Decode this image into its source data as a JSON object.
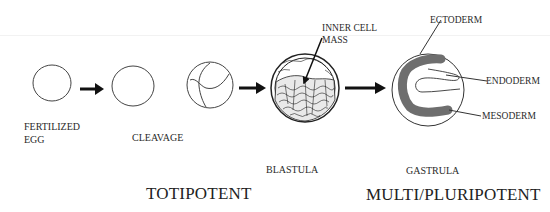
{
  "diagram": {
    "stages": [
      {
        "id": "fertilized-egg",
        "label_line1": "FERTILIZED",
        "label_line2": "EGG"
      },
      {
        "id": "cleavage",
        "label": "CLEAVAGE"
      },
      {
        "id": "blastula",
        "label": "BLASTULA"
      },
      {
        "id": "gastrula",
        "label": "GASTRULA"
      }
    ],
    "annotations": {
      "inner_cell_mass_line1": "INNER CELL",
      "inner_cell_mass_line2": "MASS",
      "ectoderm": "ECTODERM",
      "endoderm": "ENDODERM",
      "mesoderm": "MESODERM"
    },
    "potency": {
      "left": "TOTIPOTENT",
      "right": "MULTI/PLURIPOTENT"
    },
    "colors": {
      "stroke": "#333333",
      "mesoderm_fill": "#6e6e6e",
      "arrow": "#111111"
    }
  }
}
